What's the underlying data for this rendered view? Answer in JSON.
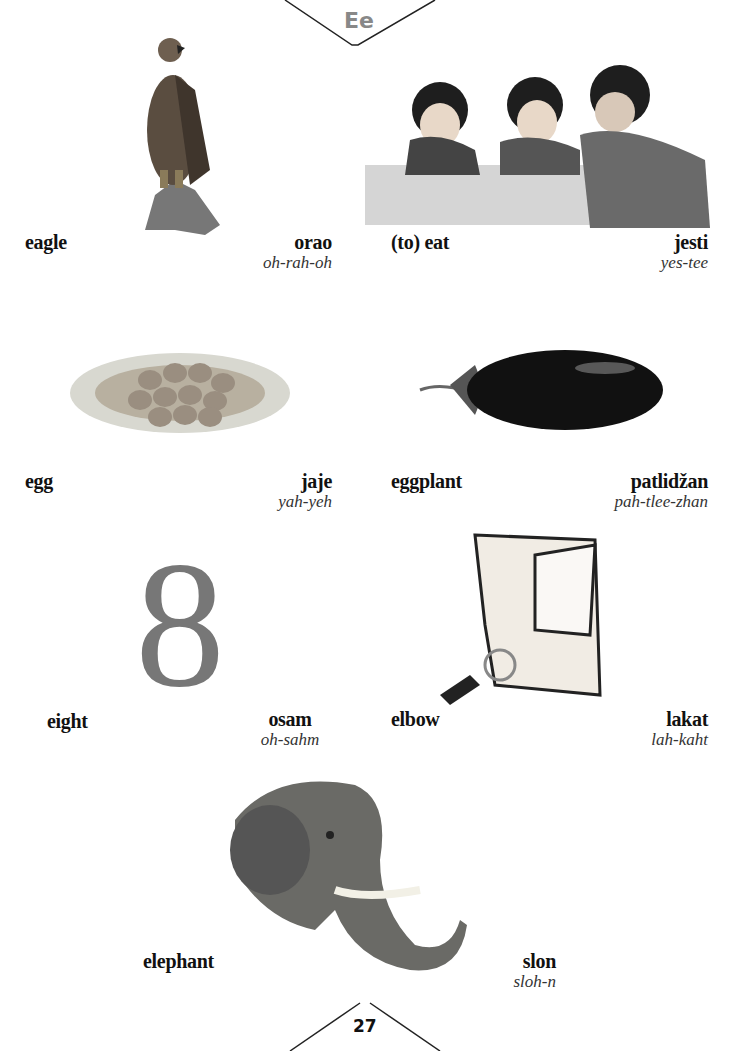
{
  "header": {
    "letter": "Ee"
  },
  "entries": [
    {
      "english": "eagle",
      "serbian": "orao",
      "pronunciation": "oh-rah-oh",
      "image": "eagle-illustration"
    },
    {
      "english": "(to) eat",
      "serbian": "jesti",
      "pronunciation": "yes-tee",
      "image": "children-eating-illustration"
    },
    {
      "english": "egg",
      "serbian": "jaje",
      "pronunciation": "yah-yeh",
      "image": "eggs-in-nest-illustration"
    },
    {
      "english": "eggplant",
      "serbian": "patlidžan",
      "pronunciation": "pah-tlee-zhan",
      "image": "eggplant-illustration"
    },
    {
      "english": "eight",
      "serbian": "osam",
      "pronunciation": "oh-sahm",
      "image": "number-eight-illustration"
    },
    {
      "english": "elbow",
      "serbian": "lakat",
      "pronunciation": "lah-kaht",
      "image": "elbow-illustration"
    },
    {
      "english": "elephant",
      "serbian": "slon",
      "pronunciation": "sloh-n",
      "image": "elephant-illustration"
    }
  ],
  "footer": {
    "page_number": "27"
  },
  "colors": {
    "header_letter": "#888888",
    "text": "#111111",
    "eight_glyph": "#777777"
  }
}
